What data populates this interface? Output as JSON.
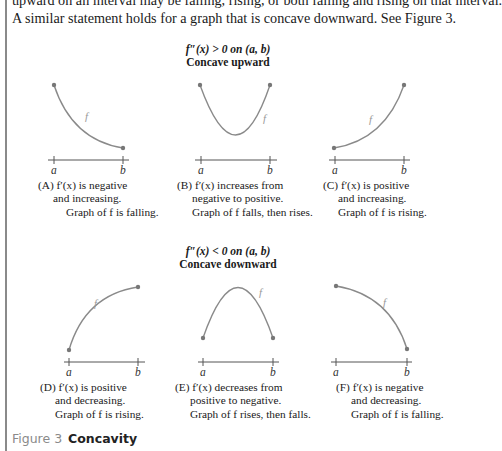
{
  "text": {
    "line1": "upward on an interval may be falling, rising, or both falling and rising on that interval.",
    "line2": "A similar statement holds for a graph that is concave downward. See Figure 3."
  },
  "upper_group": {
    "condition": "f″(x) > 0 on (a, b)",
    "title": "Concave upward"
  },
  "lower_group": {
    "condition": "f″(x) < 0 on (a, b)",
    "title": "Concave downward"
  },
  "axis_labels": {
    "a": "a",
    "b": "b",
    "curve": "f"
  },
  "panels": [
    {
      "id": "A",
      "lines": [
        "(A)  f′(x) is negative",
        "and increasing.",
        "Graph of f is falling."
      ]
    },
    {
      "id": "B",
      "lines": [
        "(B)  f′(x) increases from",
        "negative to positive.",
        "Graph of f falls, then rises."
      ]
    },
    {
      "id": "C",
      "lines": [
        "(C)  f′(x) is positive",
        "and increasing.",
        "Graph of f is rising."
      ]
    },
    {
      "id": "D",
      "lines": [
        "(D)  f′(x) is positive",
        "and decreasing.",
        "Graph of f is rising."
      ]
    },
    {
      "id": "E",
      "lines": [
        "(E)  f′(x) decreases from",
        "positive to negative.",
        "Graph of f rises, then falls."
      ]
    },
    {
      "id": "F",
      "lines": [
        "(F)  f′(x) is negative",
        "and decreasing.",
        "Graph of f is falling."
      ]
    }
  ],
  "figure": {
    "number": "Figure 3",
    "title": "Concavity"
  },
  "colors": {
    "curve": "#8a8a8a",
    "axis": "#555555",
    "text": "#1a1a1a",
    "figure_number": "#8a8a8a"
  }
}
